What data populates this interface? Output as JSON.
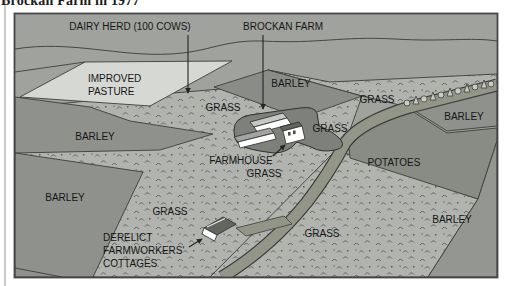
{
  "page": {
    "title": "Brockan Farm in 1977"
  },
  "map": {
    "labels": [
      {
        "id": "dairy-herd",
        "text": "DAIRY HERD (100 COWS)"
      },
      {
        "id": "brockan-farm",
        "text": "BROCKAN FARM"
      },
      {
        "id": "improved-pasture-1",
        "text": "IMPROVED"
      },
      {
        "id": "improved-pasture-2",
        "text": "PASTURE"
      },
      {
        "id": "grass-1",
        "text": "GRASS"
      },
      {
        "id": "barley-upper",
        "text": "BARLEY"
      },
      {
        "id": "grass-2",
        "text": "GRASS"
      },
      {
        "id": "barley-right",
        "text": "BARLEY"
      },
      {
        "id": "barley-left",
        "text": "BARLEY"
      },
      {
        "id": "farmhouse",
        "text": "FARMHOUSE"
      },
      {
        "id": "grass-3",
        "text": "GRASS"
      },
      {
        "id": "grass-4",
        "text": "GRASS"
      },
      {
        "id": "potatoes",
        "text": "POTATOES"
      },
      {
        "id": "barley-bottom-left",
        "text": "BARLEY"
      },
      {
        "id": "grass-5",
        "text": "GRASS"
      },
      {
        "id": "grass-6",
        "text": "GRASS"
      },
      {
        "id": "barley-bottom-right",
        "text": "BARLEY"
      },
      {
        "id": "derelict-1",
        "text": "DERELICT"
      },
      {
        "id": "derelict-2",
        "text": "FARMWORKERS'"
      },
      {
        "id": "derelict-3",
        "text": "COTTAGES"
      }
    ],
    "colors": {
      "distant": "#a0a29e",
      "grass": "#b1b3af",
      "mark": "#5a5c58",
      "pasture": "#d6d8d4",
      "barley": "#8f918d",
      "barley_dark": "#8a8c88",
      "barley_light": "#949692",
      "potatoes": "#898b85",
      "road": "#939589",
      "farmyard": "#7e807c",
      "tree": "#c8cac6",
      "wall": "#ffffff",
      "roof_light": "#c6c8c4",
      "roof_mid": "#a2a4a0",
      "roof_dark": "#63655f",
      "line": "#3c3e3a",
      "border": "#454745"
    }
  }
}
